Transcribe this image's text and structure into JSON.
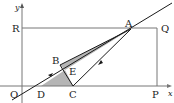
{
  "diagram": {
    "type": "coordinate-geometry-figure",
    "axes": {
      "x_label": "x",
      "y_label": "y",
      "origin_label": "O"
    },
    "points": [
      {
        "label": "A",
        "x": 131,
        "y": 29
      },
      {
        "label": "B",
        "x": 60,
        "y": 65
      },
      {
        "label": "C",
        "x": 73,
        "y": 86
      },
      {
        "label": "D",
        "x": 41,
        "y": 86
      },
      {
        "label": "E",
        "x": 65,
        "y": 70
      },
      {
        "label": "P",
        "x": 157,
        "y": 86
      },
      {
        "label": "Q",
        "x": 157,
        "y": 28
      },
      {
        "label": "R",
        "x": 22,
        "y": 28
      }
    ],
    "labels": {
      "O": "O",
      "A": "A",
      "B": "B",
      "C": "C",
      "D": "D",
      "E": "E",
      "P": "P",
      "Q": "Q",
      "R": "R",
      "x": "x",
      "y": "y"
    },
    "colors": {
      "line": "#1a1a1a",
      "frame": "#777777",
      "shade": "#b5b5b5"
    }
  }
}
